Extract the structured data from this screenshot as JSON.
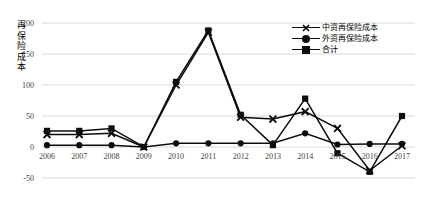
{
  "chart_data": {
    "type": "line",
    "title": "",
    "xlabel": "",
    "ylabel": "再保险成本",
    "categories": [
      "2006",
      "2007",
      "2008",
      "2009",
      "2010",
      "2011",
      "2012",
      "2013",
      "2014",
      "2015",
      "2016",
      "2017"
    ],
    "ylim": [
      -50,
      200
    ],
    "yticks": [
      200,
      150,
      100,
      50,
      0,
      -50
    ],
    "grid": true,
    "legend_position": "top-right",
    "series": [
      {
        "name": "中资再保险成本",
        "marker": "cross",
        "values": [
          20,
          20,
          22,
          0,
          100,
          185,
          48,
          45,
          57,
          30,
          -38,
          2
        ]
      },
      {
        "name": "外资再保险成本",
        "marker": "circle",
        "values": [
          3,
          3,
          3,
          0,
          6,
          6,
          6,
          6,
          22,
          4,
          5,
          5
        ]
      },
      {
        "name": "合计",
        "marker": "square",
        "values": [
          26,
          26,
          30,
          0,
          105,
          188,
          52,
          3,
          78,
          -10,
          -40,
          50
        ]
      }
    ]
  },
  "axis": {
    "y_title_chars": "再保险成本",
    "ytick_labels": [
      "200",
      "150",
      "100",
      "50",
      "0",
      "-50"
    ],
    "xtick_labels": [
      "2006",
      "2007",
      "2008",
      "2009",
      "2010",
      "2011",
      "2012",
      "2013",
      "2014",
      "2015",
      "2016",
      "2017"
    ]
  },
  "legend": {
    "entries": [
      {
        "label": "中资再保险成本",
        "marker": "cross"
      },
      {
        "label": "外资再保险成本",
        "marker": "circle"
      },
      {
        "label": "合计",
        "marker": "square"
      }
    ]
  },
  "colors": {
    "line": "#0d0d0d",
    "grid": "#d9d9d9",
    "tick_text": "#3f3f3f",
    "background": "#ffffff"
  }
}
